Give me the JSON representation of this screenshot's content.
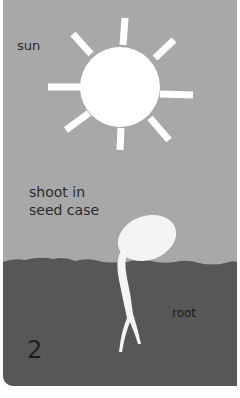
{
  "panel": {
    "step_number": "2",
    "labels": {
      "sun": "sun",
      "shoot_line1": "shoot in",
      "shoot_line2": "seed case",
      "root": "root"
    },
    "colors": {
      "sky": "#a8a8a8",
      "soil": "#575757",
      "sun": "#ffffff",
      "seedling": "#f4f4f4",
      "text": "#2a2a2a"
    },
    "icons": [
      "sun-icon",
      "seedling-icon"
    ]
  }
}
